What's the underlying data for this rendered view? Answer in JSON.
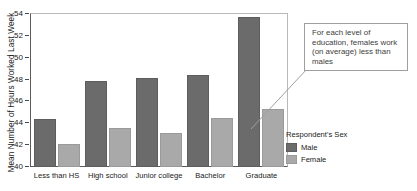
{
  "chart_data": {
    "type": "bar",
    "title": "",
    "xlabel": "",
    "ylabel": "Mean Number of Hours Worked Last Week",
    "ylim": [
      40,
      54
    ],
    "ytick_step": 2,
    "yticks": [
      40,
      42,
      44,
      46,
      48,
      50,
      52,
      54
    ],
    "grid": false,
    "categories": [
      "Less than HS",
      "High school",
      "Junior college",
      "Bachelor",
      "Graduate"
    ],
    "legend_title": "Respondent's Sex",
    "legend_position": "right-bottom",
    "series": [
      {
        "name": "Male",
        "color": "#6b6b6b",
        "values": [
          44.4,
          47.9,
          48.1,
          48.4,
          53.7
        ]
      },
      {
        "name": "Female",
        "color": "#a9a9a9",
        "values": [
          42.1,
          43.6,
          43.1,
          44.5,
          45.3
        ]
      }
    ],
    "annotations": [
      {
        "text": "For each level of education, females work (on average) less than males",
        "points_to": "Graduate / Female bar"
      }
    ]
  },
  "axis": {
    "y_title": "Mean Number of Hours Worked Last Week"
  },
  "legend": {
    "title": "Respondent's Sex",
    "items": [
      {
        "label": "Male"
      },
      {
        "label": "Female"
      }
    ]
  },
  "callout": {
    "text": "For each level of education, females work (on average) less than males"
  },
  "colors": {
    "male": "#6b6b6b",
    "female": "#a9a9a9",
    "plot_background": "#ffffff",
    "axis_line": "#5a5a5a",
    "callout_border": "#9f9f9f"
  }
}
